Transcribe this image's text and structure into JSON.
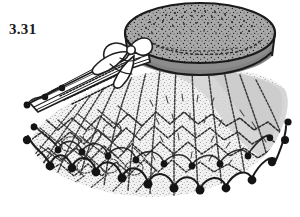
{
  "figure": {
    "label": "3.31",
    "label_name": "figure-number",
    "background_color": "#ffffff",
    "ink_color": "#1a1a1a"
  },
  "illustration": {
    "name": "line-drawing-illustration",
    "style": "stippled pen-and-ink archaeological line drawing",
    "parts": [
      {
        "name": "drum-top-disc",
        "description": "elliptical stippled top surface of truncated cone, cropped at upper edge of frame",
        "fill": "#a9a9a9",
        "stipple": "#2b2b2b"
      },
      {
        "name": "drum-side-band",
        "description": "darker gray cylindrical side band below rim",
        "fill": "#8c8c8c"
      },
      {
        "name": "rim-line",
        "description": "dark outline separating top disc from side band",
        "stroke": "#1a1a1a"
      },
      {
        "name": "netted-skirt",
        "description": "flaring mesh skirt of radiating cords with zigzag and lozenge knotting",
        "fill": "#e8e8e8",
        "stroke": "#3a3a3a"
      },
      {
        "name": "shadow-wash",
        "description": "light gray tonal wash on the upper right of the skirt",
        "fill": "#d6d6d6"
      },
      {
        "name": "beaded-fringe",
        "description": "scalloped looped cord border terminating in round dark beads around the lower margin",
        "bead_color": "#141414",
        "bead_count": 21
      },
      {
        "name": "tapered-projection",
        "description": "long narrow tapering spout or handle extending to the lower left with two beads near its tip",
        "stroke": "#1f1f1f"
      },
      {
        "name": "ribbon-bow-knot",
        "description": "looped ribbon or cord bow tied where the projection meets the vessel body",
        "stroke": "#1f1f1f"
      }
    ]
  },
  "palette": {
    "background": "#ffffff",
    "ink": "#1a1a1a",
    "top_gray": "#a9a9a9",
    "band_gray": "#8c8c8c",
    "skirt_light": "#ededed",
    "wash_gray": "#d6d6d6",
    "bead_black": "#141414"
  }
}
